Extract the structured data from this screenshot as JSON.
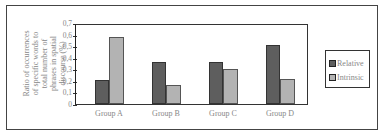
{
  "chart_data": {
    "type": "bar",
    "title": "",
    "xlabel": "",
    "ylabel": "Ratio of occurrences of specific words to total number of phrases in spatial discourse (%)",
    "categories": [
      "Group A",
      "Group B",
      "Group C",
      "Group D"
    ],
    "series": [
      {
        "name": "Relative",
        "color": "#5e5e5e",
        "values": [
          0.21,
          0.37,
          0.37,
          0.52
        ]
      },
      {
        "name": "Intrinsic",
        "color": "#b3b3b3",
        "values": [
          0.59,
          0.17,
          0.31,
          0.22
        ]
      }
    ],
    "ylim": [
      0,
      0.7
    ],
    "yticks": [
      "0",
      "0,1",
      "0,2",
      "0,3",
      "0,4",
      "0,5",
      "0,6",
      "0,7"
    ],
    "grid": false,
    "legend_position": "right"
  },
  "legend": {
    "items": [
      {
        "label": "Relative",
        "color": "#5e5e5e"
      },
      {
        "label": "Intrinsic",
        "color": "#b3b3b3"
      }
    ]
  }
}
